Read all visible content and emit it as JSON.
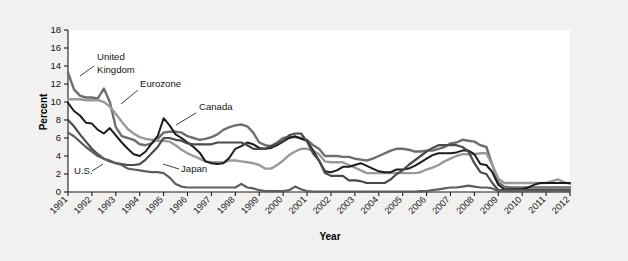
{
  "figure": {
    "background_color": "#f2f1ef",
    "plot_background_color": "#ffffff"
  },
  "chart_data": {
    "type": "line",
    "title": "",
    "xlabel": "Year",
    "ylabel": "Percent",
    "xlim": [
      1991,
      2012
    ],
    "ylim": [
      0,
      18
    ],
    "ytick_step": 2,
    "grid": false,
    "legend_position": "inline-annotations",
    "x_tick_labels": [
      "1991",
      "1992",
      "1993",
      "1994",
      "1995",
      "1996",
      "1997",
      "1998",
      "1999",
      "2000",
      "2001",
      "2002",
      "2003",
      "2004",
      "2005",
      "2006",
      "2007",
      "2008",
      "2009",
      "2010",
      "2011",
      "2012"
    ],
    "y_tick_labels": [
      "0",
      "2",
      "4",
      "6",
      "8",
      "10",
      "12",
      "14",
      "16",
      "18"
    ],
    "x": [
      1991.0,
      1991.25,
      1991.5,
      1991.75,
      1992.0,
      1992.25,
      1992.5,
      1992.75,
      1993.0,
      1993.25,
      1993.5,
      1993.75,
      1994.0,
      1994.25,
      1994.5,
      1994.75,
      1995.0,
      1995.25,
      1995.5,
      1995.75,
      1996.0,
      1996.25,
      1996.5,
      1996.75,
      1997.0,
      1997.25,
      1997.5,
      1997.75,
      1998.0,
      1998.25,
      1998.5,
      1998.75,
      1999.0,
      1999.25,
      1999.5,
      1999.75,
      2000.0,
      2000.25,
      2000.5,
      2000.75,
      2001.0,
      2001.25,
      2001.5,
      2001.75,
      2002.0,
      2002.25,
      2002.5,
      2002.75,
      2003.0,
      2003.25,
      2003.5,
      2003.75,
      2004.0,
      2004.25,
      2004.5,
      2004.75,
      2005.0,
      2005.25,
      2005.5,
      2005.75,
      2006.0,
      2006.25,
      2006.5,
      2006.75,
      2007.0,
      2007.25,
      2007.5,
      2007.75,
      2008.0,
      2008.25,
      2008.5,
      2008.75,
      2009.0,
      2009.25,
      2009.5,
      2009.75,
      2010.0,
      2010.25,
      2010.5,
      2010.75,
      2011.0,
      2011.25,
      2011.5,
      2011.75,
      2012.0
    ],
    "series": [
      {
        "name": "United Kingdom",
        "color": "#6e6e6e",
        "width": 2.4,
        "values": [
          13.3,
          11.4,
          10.7,
          10.5,
          10.5,
          10.4,
          11.5,
          10.0,
          7.2,
          6.2,
          6.0,
          5.8,
          5.3,
          5.2,
          5.4,
          5.9,
          6.6,
          6.7,
          6.7,
          6.6,
          6.2,
          6.0,
          5.8,
          5.9,
          6.1,
          6.4,
          6.9,
          7.2,
          7.4,
          7.5,
          7.3,
          6.6,
          5.5,
          5.2,
          5.1,
          5.5,
          6.0,
          6.1,
          6.1,
          6.0,
          5.8,
          5.2,
          4.8,
          4.0,
          4.0,
          4.0,
          3.9,
          3.9,
          3.7,
          3.6,
          3.5,
          3.7,
          4.0,
          4.3,
          4.6,
          4.8,
          4.8,
          4.7,
          4.5,
          4.5,
          4.6,
          4.6,
          4.8,
          5.0,
          5.4,
          5.5,
          5.8,
          5.7,
          5.6,
          5.2,
          5.0,
          3.0,
          1.1,
          0.6,
          0.5,
          0.5,
          0.5,
          0.5,
          0.5,
          0.5,
          0.5,
          0.5,
          0.5,
          0.5,
          0.5
        ]
      },
      {
        "name": "Eurozone",
        "color": "#9a9a9a",
        "width": 2.4,
        "values": [
          10.3,
          10.3,
          10.3,
          10.2,
          10.2,
          10.2,
          10.0,
          9.5,
          8.7,
          7.8,
          7.0,
          6.5,
          6.1,
          5.9,
          5.8,
          5.7,
          5.7,
          5.6,
          5.2,
          4.7,
          4.3,
          4.0,
          3.7,
          3.4,
          3.3,
          3.3,
          3.3,
          3.5,
          3.5,
          3.4,
          3.3,
          3.2,
          3.0,
          2.6,
          2.6,
          3.0,
          3.5,
          4.1,
          4.5,
          4.8,
          4.8,
          4.6,
          4.2,
          3.4,
          3.3,
          3.3,
          3.3,
          3.0,
          2.7,
          2.4,
          2.1,
          2.1,
          2.1,
          2.1,
          2.1,
          2.1,
          2.1,
          2.1,
          2.1,
          2.2,
          2.5,
          2.7,
          3.0,
          3.4,
          3.7,
          4.0,
          4.2,
          4.2,
          4.2,
          4.3,
          4.3,
          3.0,
          1.5,
          1.0,
          1.0,
          1.0,
          1.0,
          1.0,
          1.0,
          1.0,
          1.0,
          1.2,
          1.4,
          1.1,
          0.9
        ]
      },
      {
        "name": "Canada",
        "color": "#1c1c1c",
        "width": 2.0,
        "values": [
          9.9,
          9.0,
          8.5,
          7.7,
          7.6,
          6.9,
          6.5,
          7.1,
          6.3,
          5.5,
          4.8,
          4.2,
          4.0,
          4.5,
          5.4,
          6.2,
          8.2,
          7.4,
          6.4,
          6.0,
          5.5,
          5.0,
          4.4,
          3.4,
          3.2,
          3.1,
          3.2,
          3.8,
          4.8,
          5.1,
          5.5,
          5.3,
          4.9,
          4.8,
          4.9,
          5.2,
          5.6,
          6.0,
          6.2,
          5.9,
          5.7,
          4.6,
          3.5,
          2.3,
          2.2,
          2.4,
          2.8,
          2.8,
          3.0,
          3.2,
          2.9,
          2.6,
          2.3,
          2.2,
          2.2,
          2.5,
          2.5,
          2.6,
          2.9,
          3.3,
          3.7,
          4.1,
          4.3,
          4.3,
          4.3,
          4.4,
          4.6,
          4.6,
          4.2,
          3.1,
          3.0,
          2.2,
          0.8,
          0.3,
          0.3,
          0.3,
          0.3,
          0.5,
          0.8,
          1.0,
          1.0,
          1.0,
          1.0,
          1.0,
          1.0
        ]
      },
      {
        "name": "U.S.",
        "color": "#4a4a4a",
        "width": 2.2,
        "values": [
          8.0,
          7.3,
          6.4,
          5.6,
          4.8,
          4.2,
          3.7,
          3.4,
          3.2,
          3.1,
          3.0,
          3.0,
          3.1,
          3.6,
          4.3,
          5.0,
          6.0,
          6.0,
          5.8,
          5.7,
          5.4,
          5.3,
          5.3,
          5.3,
          5.3,
          5.5,
          5.5,
          5.5,
          5.5,
          5.5,
          5.2,
          4.8,
          4.8,
          4.8,
          5.1,
          5.4,
          5.7,
          6.3,
          6.5,
          6.5,
          5.6,
          4.3,
          3.5,
          2.1,
          1.8,
          1.8,
          1.8,
          1.3,
          1.3,
          1.2,
          1.0,
          1.0,
          1.0,
          1.0,
          1.4,
          2.0,
          2.4,
          3.0,
          3.5,
          4.0,
          4.5,
          4.9,
          5.2,
          5.2,
          5.2,
          5.2,
          5.0,
          4.5,
          3.2,
          2.2,
          2.0,
          1.0,
          0.2,
          0.2,
          0.2,
          0.2,
          0.2,
          0.2,
          0.2,
          0.2,
          0.2,
          0.2,
          0.2,
          0.2,
          0.2
        ]
      },
      {
        "name": "Japan",
        "color": "#5e5e5e",
        "width": 2.2,
        "values": [
          6.6,
          6.2,
          5.6,
          5.0,
          4.5,
          4.0,
          3.7,
          3.5,
          3.2,
          3.0,
          2.6,
          2.5,
          2.4,
          2.3,
          2.2,
          2.2,
          2.1,
          1.6,
          0.9,
          0.6,
          0.5,
          0.5,
          0.5,
          0.5,
          0.5,
          0.5,
          0.5,
          0.5,
          0.5,
          0.9,
          0.5,
          0.4,
          0.2,
          0.1,
          0.1,
          0.1,
          0.1,
          0.2,
          0.6,
          0.3,
          0.1,
          0.05,
          0.05,
          0.05,
          0.05,
          0.05,
          0.05,
          0.05,
          0.05,
          0.05,
          0.05,
          0.05,
          0.05,
          0.05,
          0.05,
          0.05,
          0.05,
          0.05,
          0.05,
          0.1,
          0.1,
          0.2,
          0.3,
          0.4,
          0.5,
          0.5,
          0.6,
          0.7,
          0.6,
          0.5,
          0.5,
          0.4,
          0.1,
          0.1,
          0.1,
          0.1,
          0.1,
          0.1,
          0.1,
          0.1,
          0.1,
          0.1,
          0.1,
          0.1,
          0.1
        ]
      }
    ],
    "annotations": [
      {
        "id": "united-kingdom",
        "text_line1": "United",
        "text_line2": "Kingdom",
        "tx": 97,
        "ty": 60,
        "leader": "M 94,66 L 80,76"
      },
      {
        "id": "eurozone",
        "text_line1": "Eurozone",
        "text_line2": "",
        "tx": 140,
        "ty": 87,
        "leader": "M 138,90 L 121,104"
      },
      {
        "id": "canada",
        "text_line1": "Canada",
        "text_line2": "",
        "tx": 199,
        "ty": 110,
        "leader": "M 196,113 L 176,125"
      },
      {
        "id": "us",
        "text_line1": "U.S.",
        "text_line2": "",
        "tx": 74,
        "ty": 174,
        "leader": "M 92,171 L 103,164"
      },
      {
        "id": "japan",
        "text_line1": "Japan",
        "text_line2": "",
        "tx": 181,
        "ty": 172,
        "leader": "M 179,169 L 163,164"
      }
    ]
  }
}
